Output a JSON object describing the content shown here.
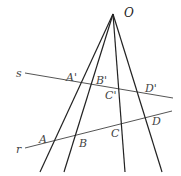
{
  "diagram": {
    "title": "",
    "origin": {
      "label": "O",
      "x": 113,
      "y": 14
    },
    "lines": [
      {
        "label": "s",
        "x1": 25,
        "y1": 73,
        "x2": 173,
        "y2": 98,
        "color": "#555555"
      },
      {
        "label": "r",
        "x1": 25,
        "y1": 148,
        "x2": 172,
        "y2": 111,
        "color": "#555555"
      }
    ],
    "rays": [
      {
        "name": "OA",
        "end_x": 40,
        "end_y": 172
      },
      {
        "name": "OB",
        "end_x": 64,
        "end_y": 172
      },
      {
        "name": "OC",
        "end_x": 125,
        "end_y": 172
      },
      {
        "name": "OD",
        "end_x": 162,
        "end_y": 172
      }
    ],
    "points": [
      {
        "label": "A'",
        "lx": 66,
        "ly": 81
      },
      {
        "label": "B'",
        "lx": 96,
        "ly": 84
      },
      {
        "label": "C'",
        "lx": 105,
        "ly": 99
      },
      {
        "label": "D'",
        "lx": 145,
        "ly": 92
      },
      {
        "label": "A",
        "lx": 39,
        "ly": 143
      },
      {
        "label": "B",
        "lx": 79,
        "ly": 147
      },
      {
        "label": "C",
        "lx": 111,
        "ly": 137
      },
      {
        "label": "D",
        "lx": 152,
        "ly": 125
      }
    ],
    "line_labels": [
      {
        "label": "s",
        "lx": 16,
        "ly": 77
      },
      {
        "label": "r",
        "lx": 16,
        "ly": 153
      }
    ]
  }
}
